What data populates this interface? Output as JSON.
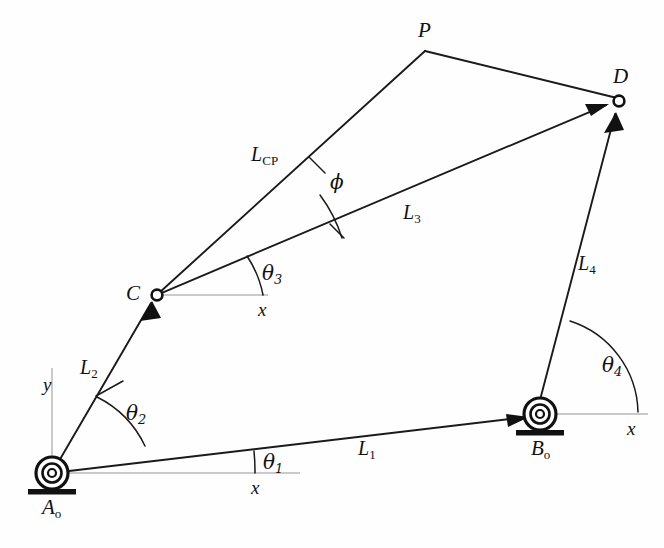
{
  "figure": {
    "type": "fourbar-linkage-vector-diagram",
    "width": 664,
    "height": 548,
    "background_color": "#fefefe",
    "line_color": "#1a1a1a",
    "axis_color": "#b9b9b9"
  },
  "points": {
    "A0": {
      "label": "A",
      "subscript": "o",
      "x": 52,
      "y": 473,
      "kind": "grounded-pivot"
    },
    "B0": {
      "label": "B",
      "subscript": "o",
      "x": 540,
      "y": 414,
      "kind": "grounded-pivot"
    },
    "C": {
      "label": "C",
      "x": 157,
      "y": 295,
      "kind": "pin-joint"
    },
    "D": {
      "label": "D",
      "x": 619,
      "y": 101,
      "kind": "pin-joint"
    },
    "P": {
      "label": "P",
      "x": 425,
      "y": 50,
      "kind": "coupler-point"
    }
  },
  "links": {
    "L1": {
      "label": "L",
      "subscript": "1",
      "from": "A0",
      "to": "B0",
      "arrow_at": "to"
    },
    "L2": {
      "label": "L",
      "subscript": "2",
      "from": "A0",
      "to": "C",
      "arrow_at": "to"
    },
    "L3": {
      "label": "L",
      "subscript": "3",
      "from": "C",
      "to": "D",
      "arrow_at": "to"
    },
    "L4": {
      "label": "L",
      "subscript": "4",
      "from": "B0",
      "to": "D",
      "arrow_at": "to"
    },
    "LCP": {
      "label": "L",
      "subscript": "CP",
      "from": "C",
      "to": "P",
      "arrow_at": "none"
    },
    "PD": {
      "label": "",
      "from": "P",
      "to": "D",
      "arrow_at": "none"
    }
  },
  "angles": {
    "theta1": {
      "label": "θ",
      "subscript": "1",
      "at": "A0",
      "between": [
        "x-axis",
        "L1"
      ]
    },
    "theta2": {
      "label": "θ",
      "subscript": "2",
      "at": "A0",
      "between": [
        "L1",
        "L2"
      ]
    },
    "theta3": {
      "label": "θ",
      "subscript": "3",
      "at": "C",
      "between": [
        "x-axis",
        "L3"
      ]
    },
    "theta4": {
      "label": "θ",
      "subscript": "4",
      "at": "B0",
      "between": [
        "x-axis",
        "L4"
      ]
    },
    "phi": {
      "label": "ϕ",
      "subscript": "",
      "at": "C",
      "between": [
        "L3",
        "LCP"
      ]
    }
  },
  "axes": {
    "x_at_A0": "x",
    "x_at_C": "x",
    "x_at_B0": "x",
    "y_at_A0": "y"
  },
  "labels": {
    "point_A0": "A",
    "point_A0_sub": "o",
    "point_B0": "B",
    "point_B0_sub": "o",
    "point_C": "C",
    "point_D": "D",
    "point_P": "P",
    "link_L1": "L",
    "link_L1_sub": "1",
    "link_L2": "L",
    "link_L2_sub": "2",
    "link_L3": "L",
    "link_L3_sub": "3",
    "link_L4": "L",
    "link_L4_sub": "4",
    "link_LCP": "L",
    "link_LCP_sub": "CP",
    "angle_theta1": "θ",
    "angle_theta1_sub": "1",
    "angle_theta2": "θ",
    "angle_theta2_sub": "2",
    "angle_theta3": "θ",
    "angle_theta3_sub": "3",
    "angle_theta4": "θ",
    "angle_theta4_sub": "4",
    "angle_phi": "ϕ",
    "axis_x_A0": "x",
    "axis_x_C": "x",
    "axis_x_B0": "x",
    "axis_y_A0": "y"
  }
}
